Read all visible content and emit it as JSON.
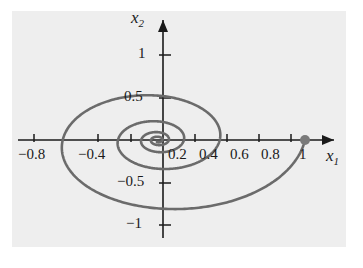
{
  "figure": {
    "kind": "phase-portrait",
    "background_color": "#ffffff",
    "plot_background_color": "#eeeeee",
    "curve_color": "#6b6b6b",
    "axis_color": "#1a1a1a",
    "marker_color": "#7a7a7a"
  },
  "axes": {
    "x_label": "x",
    "x_label_sub": "1",
    "y_label": "x",
    "y_label_sub": "2"
  },
  "chart_data": {
    "type": "line",
    "title": "",
    "subtitle": "",
    "xlabel": "x_1",
    "ylabel": "x_2",
    "xlim": [
      -1.05,
      1.12
    ],
    "ylim": [
      -1.32,
      1.22
    ],
    "grid": false,
    "legend": null,
    "x_ticks": [
      -0.8,
      -0.4,
      0.2,
      0.4,
      0.6,
      0.8,
      1
    ],
    "x_tick_labels": [
      "−0.8",
      "−0.4",
      "0.2",
      "0.4",
      "0.6",
      "0.8",
      "1"
    ],
    "y_ticks": [
      1,
      0.5,
      -0.5,
      -1
    ],
    "y_tick_labels": [
      "1",
      "0.5",
      "−0.5",
      "−1"
    ],
    "annotations": [
      {
        "name": "initial-condition-marker",
        "x": 1,
        "y": 0,
        "shape": "dot"
      }
    ],
    "series": [
      {
        "name": "trajectory",
        "description": "inward logarithmic spiral from (1,0) converging to the origin",
        "color": "#6b6b6b",
        "start": [
          1,
          0
        ],
        "end": [
          0,
          0
        ],
        "spiral": {
          "r0": 1.0,
          "decay_per_turn": 0.42,
          "direction": "clockwise",
          "turns": 4.3,
          "theta0_deg": 0
        }
      }
    ]
  },
  "tick_labels_x": [
    {
      "text": "−0.8",
      "left": 18,
      "top": 146
    },
    {
      "text": "−0.4",
      "left": 78,
      "top": 146
    },
    {
      "text": "0.2",
      "left": 168,
      "top": 146
    },
    {
      "text": "0.4",
      "left": 199,
      "top": 146
    },
    {
      "text": "0.6",
      "left": 230,
      "top": 146
    },
    {
      "text": "0.8",
      "left": 261,
      "top": 146
    },
    {
      "text": "1",
      "left": 299,
      "top": 146
    }
  ],
  "tick_labels_y": [
    {
      "text": "1",
      "left": 138,
      "top": 45
    },
    {
      "text": "0.5",
      "left": 124,
      "top": 88
    },
    {
      "text": "−0.5",
      "left": 117,
      "top": 173
    },
    {
      "text": "−1",
      "left": 126,
      "top": 215
    }
  ]
}
